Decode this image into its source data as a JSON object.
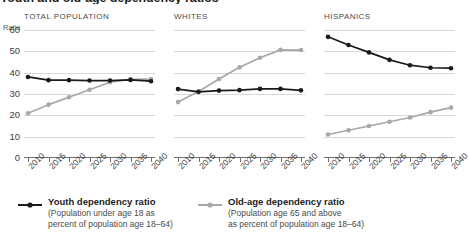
{
  "title": "Youth and old-age dependency ratios",
  "axis": {
    "unit_label": "Ratio",
    "yticks": [
      "60",
      "50",
      "40",
      "30",
      "20",
      "10",
      "0"
    ],
    "xticks": [
      "2010",
      "2015",
      "2020",
      "2025",
      "2030",
      "2035",
      "2040"
    ]
  },
  "panels": [
    {
      "title": "TOTAL POPULATION"
    },
    {
      "title": "WHITES"
    },
    {
      "title": "HISPANICS"
    }
  ],
  "legend": {
    "youth": {
      "label": "Youth dependency ratio",
      "sub1": "(Population under age 18 as",
      "sub2": "percent of population age 18–64)",
      "color": "#1a1a1a"
    },
    "oldage": {
      "label": "Old-age dependency ratio",
      "sub1": "(Population age 65 and above",
      "sub2": "as percent of population age 18–64)",
      "color": "#a8a8a8"
    }
  },
  "chart_data": {
    "type": "line",
    "title": "Youth and old-age dependency ratios",
    "xlabel": "",
    "ylabel": "Ratio",
    "ylim": [
      0,
      60
    ],
    "grid": true,
    "legend_position": "bottom",
    "x": [
      2010,
      2015,
      2020,
      2025,
      2030,
      2035,
      2040
    ],
    "panels": [
      {
        "name": "TOTAL POPULATION",
        "series": [
          {
            "name": "Youth dependency ratio",
            "color": "#1a1a1a",
            "values": [
              38.0,
              36.5,
              36.5,
              36.3,
              36.3,
              36.6,
              36.0
            ]
          },
          {
            "name": "Old-age dependency ratio",
            "color": "#a8a8a8",
            "values": [
              21.0,
              25.0,
              28.5,
              32.0,
              35.5,
              36.9,
              37.0
            ]
          }
        ]
      },
      {
        "name": "WHITES",
        "series": [
          {
            "name": "Youth dependency ratio",
            "color": "#1a1a1a",
            "values": [
              32.3,
              31.0,
              31.6,
              31.8,
              32.4,
              32.4,
              31.7
            ]
          },
          {
            "name": "Old-age dependency ratio",
            "color": "#a8a8a8",
            "values": [
              26.2,
              31.2,
              37.0,
              42.5,
              47.0,
              50.7,
              50.6
            ]
          }
        ]
      },
      {
        "name": "HISPANICS",
        "series": [
          {
            "name": "Youth dependency ratio",
            "color": "#1a1a1a",
            "values": [
              56.8,
              53.0,
              49.5,
              46.0,
              43.5,
              42.3,
              42.1
            ]
          },
          {
            "name": "Old-age dependency ratio",
            "color": "#a8a8a8",
            "values": [
              11.0,
              13.0,
              15.0,
              17.0,
              19.0,
              21.5,
              23.6
            ]
          }
        ]
      }
    ]
  }
}
